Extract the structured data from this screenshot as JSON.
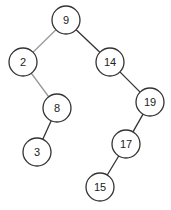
{
  "diagram": {
    "type": "binary-search-tree",
    "nodes": [
      {
        "id": "n9",
        "label": "9",
        "x": 66,
        "y": 20
      },
      {
        "id": "n2",
        "label": "2",
        "x": 23,
        "y": 62
      },
      {
        "id": "n14",
        "label": "14",
        "x": 110,
        "y": 62
      },
      {
        "id": "n8",
        "label": "8",
        "x": 57,
        "y": 108
      },
      {
        "id": "n19",
        "label": "19",
        "x": 150,
        "y": 102
      },
      {
        "id": "n3",
        "label": "3",
        "x": 37,
        "y": 152
      },
      {
        "id": "n17",
        "label": "17",
        "x": 126,
        "y": 144
      },
      {
        "id": "n15",
        "label": "15",
        "x": 100,
        "y": 187
      }
    ],
    "edges": [
      {
        "from": "n9",
        "to": "n2",
        "color": "#999999"
      },
      {
        "from": "n9",
        "to": "n14",
        "color": "#333333"
      },
      {
        "from": "n2",
        "to": "n8",
        "color": "#999999"
      },
      {
        "from": "n8",
        "to": "n3",
        "color": "#333333"
      },
      {
        "from": "n14",
        "to": "n19",
        "color": "#333333"
      },
      {
        "from": "n19",
        "to": "n17",
        "color": "#333333"
      },
      {
        "from": "n17",
        "to": "n15",
        "color": "#333333"
      }
    ],
    "node_radius": 14
  }
}
